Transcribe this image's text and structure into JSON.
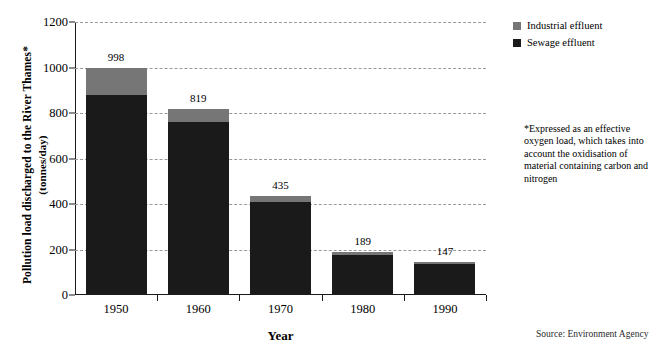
{
  "chart_data": {
    "type": "bar",
    "subtype": "stacked-vertical",
    "title": "",
    "xlabel": "Year",
    "ylabel": "Pollution load discharged to the River Thames* (tonnes/day)",
    "ylabel_line1": "Pollution load discharged to the River Thames*",
    "ylabel_line2": "(tonnes/day)",
    "categories": [
      "1950",
      "1960",
      "1970",
      "1980",
      "1990"
    ],
    "ylim": [
      0,
      1200
    ],
    "yticks": [
      0,
      200,
      400,
      600,
      800,
      1000,
      1200
    ],
    "ytick_labels": [
      "0",
      "200",
      "400",
      "600",
      "800",
      "1000",
      "1200"
    ],
    "grid": "horizontal-dashed",
    "legend_position": "top-right-outside",
    "series": [
      {
        "name": "Sewage effluent",
        "color": "#1a1a1a",
        "values": [
          880,
          760,
          410,
          178,
          136
        ]
      },
      {
        "name": "Industrial effluent",
        "color": "#767676",
        "values": [
          118,
          59,
          25,
          11,
          11
        ]
      }
    ],
    "totals": [
      998,
      819,
      435,
      189,
      147
    ],
    "data_labels": [
      "998",
      "819",
      "435",
      "189",
      "147"
    ]
  },
  "legend": {
    "items": [
      {
        "label": "Industrial effluent",
        "color": "#767676"
      },
      {
        "label": "Sewage effluent",
        "color": "#1a1a1a"
      }
    ]
  },
  "footnote": {
    "text": "*Expressed as an effective oxygen load, which takes into account the oxidisation of material containing carbon and nitrogen"
  },
  "source": {
    "text": "Source: Environment Agency"
  },
  "colors": {
    "industrial": "#767676",
    "sewage": "#1a1a1a",
    "gridline": "#9a9a9a",
    "axis": "#1a1a1a",
    "background": "#ffffff"
  }
}
